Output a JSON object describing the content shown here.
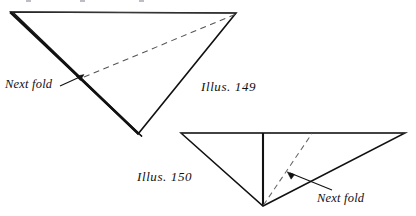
{
  "figure": {
    "type": "line-diagram",
    "background_color": "#ffffff",
    "stroke_color": "#111111",
    "dashed_stroke_color": "#666666",
    "labels": [
      {
        "id": "next_fold_top",
        "text": "Next fold",
        "style": "italic"
      },
      {
        "id": "illus_149",
        "text": "Illus. 149",
        "style": "italic"
      },
      {
        "id": "illus_150",
        "text": "Illus. 150",
        "style": "italic"
      },
      {
        "id": "next_fold_bottom",
        "text": "Next fold",
        "style": "italic"
      }
    ],
    "illustration_149": {
      "caption": "Illus. 149",
      "shape": "inverted triangle with doubled left-lower fold edge",
      "vertices": {
        "top_left": [
          11,
          12
        ],
        "top_right": [
          236,
          13
        ],
        "bottom": [
          138,
          134
        ]
      },
      "dashed_fold_line": {
        "from": [
          236,
          14
        ],
        "to": [
          83,
          77
        ]
      },
      "annotation": "Next fold",
      "arrow": {
        "tail": [
          62,
          85
        ],
        "head": [
          84,
          75
        ]
      }
    },
    "illustration_150": {
      "caption": "Illus. 150",
      "shape": "inverted triangle with vertical solid fold and diagonal dashed fold",
      "vertices": {
        "top_left": [
          181,
          133
        ],
        "top_right": [
          405,
          133
        ],
        "bottom": [
          263,
          206
        ]
      },
      "vertical_fold_line": {
        "from": [
          263,
          133
        ],
        "to": [
          263,
          206
        ]
      },
      "dashed_fold_line": {
        "from": [
          263,
          206
        ],
        "to": [
          312,
          133
        ]
      },
      "annotation": "Next fold",
      "arrow": {
        "tail": [
          330,
          190
        ],
        "head": [
          288,
          172
        ]
      }
    },
    "crop_marks": [
      {
        "x": 26,
        "y": 0
      },
      {
        "x": 80,
        "y": 0
      },
      {
        "x": 139,
        "y": 0
      }
    ]
  }
}
